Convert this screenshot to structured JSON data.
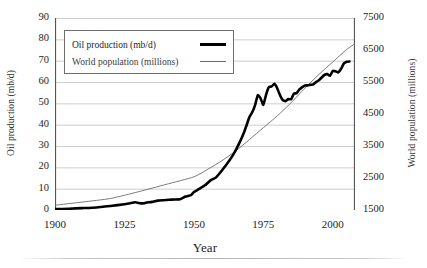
{
  "chart_data": {
    "type": "line",
    "title": "",
    "xlabel": "Year",
    "ylabel": "Oil production (mb/d)",
    "ylabel_right": "World population (millions)",
    "xlim": [
      1900,
      2008
    ],
    "ylim": [
      0,
      90
    ],
    "ylim_right": [
      1500,
      7500
    ],
    "xticks": [
      1900,
      1925,
      1950,
      1975,
      2000
    ],
    "xtick_labels": [
      "1900",
      "1925",
      "1950",
      "1975",
      "2000"
    ],
    "yticks": [
      0,
      10,
      20,
      30,
      40,
      50,
      60,
      70,
      80,
      90
    ],
    "ytick_labels": [
      "0",
      "10",
      "20",
      "30",
      "40",
      "50",
      "60",
      "70",
      "80",
      "90"
    ],
    "yticks_right": [
      1500,
      2500,
      3500,
      4500,
      5500,
      6500,
      7500
    ],
    "ytick_labels_right": [
      "1500",
      "2500",
      "3500",
      "4500",
      "5500",
      "6500",
      "7500"
    ],
    "grid": "horizontal",
    "legend_position": "upper-left-inside",
    "series": [
      {
        "name": "Oil production (mb/d)",
        "axis": "left",
        "color": "#000000",
        "line_width": 2.6,
        "x": [
          1900,
          1905,
          1910,
          1915,
          1920,
          1925,
          1927,
          1929,
          1930,
          1931,
          1932,
          1933,
          1935,
          1937,
          1939,
          1941,
          1943,
          1945,
          1947,
          1949,
          1950,
          1952,
          1954,
          1956,
          1958,
          1960,
          1962,
          1964,
          1966,
          1968,
          1970,
          1971,
          1972,
          1973,
          1974,
          1975,
          1976,
          1977,
          1978,
          1979,
          1980,
          1981,
          1982,
          1983,
          1984,
          1985,
          1986,
          1987,
          1988,
          1989,
          1990,
          1991,
          1992,
          1993,
          1994,
          1995,
          1996,
          1997,
          1998,
          1999,
          2000,
          2001,
          2002,
          2003,
          2004,
          2005,
          2006
        ],
        "y": [
          0.4,
          0.6,
          0.9,
          1.2,
          1.9,
          2.7,
          3.2,
          3.6,
          3.3,
          3.1,
          3.2,
          3.5,
          3.8,
          4.4,
          4.6,
          4.8,
          4.9,
          5.0,
          6.3,
          7.0,
          8.4,
          10.0,
          11.6,
          13.9,
          15.3,
          18.4,
          21.8,
          25.6,
          30.4,
          36.2,
          43.6,
          45.8,
          49.0,
          53.9,
          52.3,
          49.3,
          54.1,
          57.6,
          57.9,
          59.2,
          57.1,
          53.8,
          51.5,
          51.0,
          52.0,
          51.9,
          54.5,
          54.8,
          56.5,
          57.6,
          58.4,
          58.4,
          58.7,
          58.9,
          60.0,
          60.8,
          62.1,
          63.3,
          63.7,
          62.9,
          65.2,
          65.0,
          64.5,
          66.2,
          68.7,
          69.5,
          69.6
        ],
        "note": "Thick black line; ~0 at 1900, Depression dip 1930-1932, steep post-war climb, 1973 and 1979 peaks, early-1980s crash, recovery to ~80 mb/d by 2006"
      },
      {
        "name": "World population (millions)",
        "axis": "right",
        "color": "#6b6b6b",
        "line_width": 0.9,
        "x": [
          1900,
          1910,
          1920,
          1930,
          1940,
          1950,
          1955,
          1960,
          1965,
          1970,
          1975,
          1980,
          1985,
          1990,
          1995,
          2000,
          2005,
          2008
        ],
        "y": [
          1650,
          1750,
          1860,
          2070,
          2300,
          2536,
          2773,
          3035,
          3340,
          3700,
          4071,
          4440,
          4853,
          5310,
          5735,
          6127,
          6515,
          6700
        ],
        "note": "Thin grey smooth exponential curve; crosses the oil curve around 1962"
      }
    ],
    "legend": [
      {
        "label": "Oil production (mb/d)",
        "style": "thick-black"
      },
      {
        "label": "World population (millions)",
        "style": "thin-grey"
      }
    ],
    "colors": {
      "oil": "#000000",
      "population": "#6b6b6b",
      "grid": "#bfbfbf",
      "axis": "#555555",
      "text": "#1d1d1d",
      "background": "#ffffff"
    }
  }
}
